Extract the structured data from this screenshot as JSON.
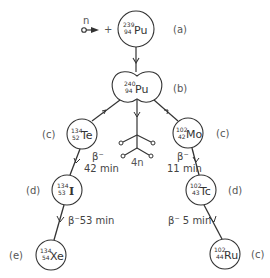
{
  "diagram": {
    "neutron": {
      "label": "n",
      "plus": "+"
    },
    "nuclei": [
      {
        "id": "pu239",
        "mass": "239",
        "atomic": "94",
        "symbol": "Pu",
        "stage": "(a)"
      },
      {
        "id": "pu240",
        "mass": "240",
        "atomic": "94",
        "symbol": "Pu",
        "stage": "(b)"
      },
      {
        "id": "te134",
        "mass": "134",
        "atomic": "52",
        "symbol": "Te",
        "stage": "(c)"
      },
      {
        "id": "mo102",
        "mass": "102",
        "atomic": "42",
        "symbol": "Mo",
        "stage": "(c)"
      },
      {
        "id": "i134",
        "mass": "134",
        "atomic": "53",
        "symbol": "I",
        "stage": "(d)"
      },
      {
        "id": "tc102",
        "mass": "102",
        "atomic": "43",
        "symbol": "Tc",
        "stage": "(d)"
      },
      {
        "id": "xe134",
        "mass": "134",
        "atomic": "54",
        "symbol": "Xe",
        "stage": "(e)"
      },
      {
        "id": "ru102",
        "mass": "102",
        "atomic": "44",
        "symbol": "Ru",
        "stage": "(c)"
      }
    ],
    "emitted_neutrons": {
      "label": "4n"
    },
    "decays": [
      {
        "from": "te134",
        "to": "i134",
        "type": "β⁻",
        "half_life": "42 min"
      },
      {
        "from": "i134",
        "to": "xe134",
        "type": "β⁻",
        "half_life": "53 min",
        "combined": "β⁻53 min"
      },
      {
        "from": "mo102",
        "to": "tc102",
        "type": "β⁻",
        "half_life": "11 min"
      },
      {
        "from": "tc102",
        "to": "ru102",
        "type": "β⁻",
        "half_life": "5 min",
        "combined": "β⁻ 5 min"
      }
    ],
    "colors": {
      "stroke": "#333333",
      "text": "#444444",
      "background": "#ffffff"
    }
  }
}
